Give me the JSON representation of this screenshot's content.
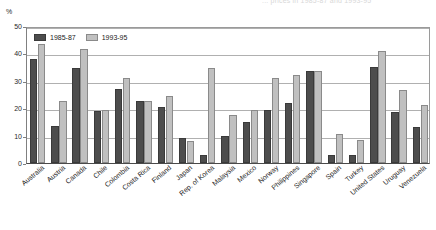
{
  "top_caption": "... prices in 1985-87 and 1993-95",
  "axis": {
    "y_unit": "%",
    "y_ticks": [
      0,
      10,
      20,
      30,
      40,
      50
    ],
    "y_min": 0,
    "y_max": 50
  },
  "legend": {
    "position": "top-left-inside",
    "items": [
      {
        "label": "1985-87",
        "color": "#4d4d4d"
      },
      {
        "label": "1993-95",
        "color": "#c0c0c0"
      }
    ]
  },
  "chart_data": {
    "type": "bar",
    "title": "",
    "xlabel": "",
    "ylabel": "%",
    "ylim": [
      0,
      50
    ],
    "grid": true,
    "legend_position": "top-left-inside",
    "categories": [
      "Australia",
      "Austria",
      "Canada",
      "Chile",
      "Colombia",
      "Costa Rica",
      "Finland",
      "Japan",
      "Rep. of Korea",
      "Malaysia",
      "Mexico",
      "Norway",
      "Philippines",
      "Singapore",
      "Spain",
      "Turkey",
      "United States",
      "Uruguay",
      "Venezuela"
    ],
    "series": [
      {
        "name": "1985-87",
        "color": "#4d4d4d",
        "values": [
          38,
          13.5,
          34.5,
          19,
          27,
          22.5,
          20.5,
          9,
          3,
          10,
          15,
          19.5,
          22,
          33.5,
          3,
          3,
          35,
          18.5,
          13
        ]
      },
      {
        "name": "1993-95",
        "color": "#c0c0c0",
        "values": [
          43.5,
          22.5,
          41.5,
          19.5,
          31,
          22.5,
          24.5,
          8,
          34.5,
          17.5,
          19.5,
          31,
          32,
          33.5,
          10.5,
          8.5,
          41,
          26.5,
          21
        ]
      }
    ]
  }
}
